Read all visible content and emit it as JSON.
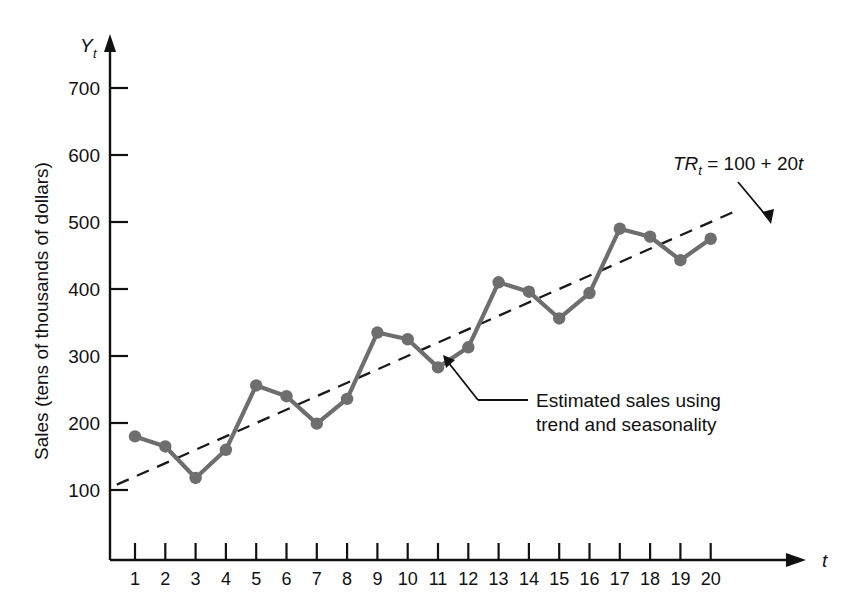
{
  "chart_data": {
    "type": "line",
    "title": "",
    "xlabel": "t",
    "ylabel": "Sales (tens of thousands of dollars)",
    "xlim": [
      0,
      21
    ],
    "ylim": [
      0,
      760
    ],
    "grid": false,
    "legend": "none",
    "x": [
      1,
      2,
      3,
      4,
      5,
      6,
      7,
      8,
      9,
      10,
      11,
      12,
      13,
      14,
      15,
      16,
      17,
      18,
      19,
      20
    ],
    "xtick_labels": [
      "1",
      "2",
      "3",
      "4",
      "5",
      "6",
      "7",
      "8",
      "9",
      "10",
      "11",
      "12",
      "13",
      "14",
      "15",
      "16",
      "17",
      "18",
      "19",
      "20"
    ],
    "ytick_labels": [
      "100",
      "200",
      "300",
      "400",
      "500",
      "600",
      "700"
    ],
    "ytick_values": [
      100,
      200,
      300,
      400,
      500,
      600,
      700
    ],
    "series": [
      {
        "name": "Estimated sales using trend and seasonality",
        "style": "solid-with-markers",
        "color": "#6e6e6e",
        "values": [
          180,
          165,
          118,
          160,
          256,
          240,
          199,
          236,
          335,
          325,
          283,
          313,
          410,
          396,
          356,
          394,
          490,
          478,
          443,
          475
        ]
      },
      {
        "name": "TR_t = 100 + 20t",
        "style": "dashed",
        "color": "#1a1a1a",
        "x": [
          0.4,
          20.8
        ],
        "values": [
          108,
          516
        ]
      }
    ],
    "annotations": [
      {
        "name": "trend-equation",
        "text": "TRt = 100 + 20t",
        "parts": {
          "tr": "TR",
          "sub": "t",
          "rest": " = 100 + 20",
          "tail": "t"
        }
      },
      {
        "name": "estimated-sales-note",
        "line1": "Estimated sales using",
        "line2": "trend and seasonality"
      }
    ],
    "axis_symbols": {
      "y_axis_name": "Y",
      "y_axis_sub": "t",
      "x_axis_name": "t"
    },
    "colors": {
      "series": "#6e6e6e",
      "trend": "#1a1a1a",
      "axis": "#111111",
      "background": "#ffffff"
    }
  }
}
